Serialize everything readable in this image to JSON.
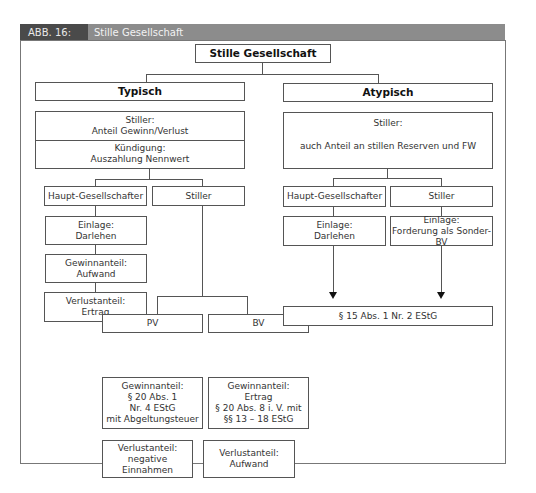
{
  "header": {
    "figure_label": "ABB. 16:",
    "title": "Stille Gesellschaft"
  },
  "diagram": {
    "root": "Stille Gesellschaft",
    "typisch": {
      "label": "Typisch",
      "info": {
        "line1a": "Stiller:",
        "line1b": "Anteil Gewinn/Verlust",
        "line2a": "Kündigung:",
        "line2b": "Auszahlung Nennwert"
      },
      "haupt": {
        "label": "Haupt-Gesellschafter",
        "einlage_a": "Einlage:",
        "einlage_b": "Darlehen",
        "gewinn_a": "Gewinnanteil:",
        "gewinn_b": "Aufwand",
        "verlust_a": "Verlustanteil:",
        "verlust_b": "Ertrag"
      },
      "stiller": {
        "label": "Stiller",
        "pv": {
          "label": "PV",
          "gewinn": [
            "Gewinnanteil:",
            "§ 20 Abs. 1",
            "Nr. 4 EStG",
            "mit Abgeltungsteuer"
          ],
          "verlust": [
            "Verlustanteil:",
            "negative",
            "Einnahmen"
          ]
        },
        "bv": {
          "label": "BV",
          "gewinn": [
            "Gewinnanteil:",
            "Ertrag",
            "§ 20 Abs. 8 i. V. mit",
            "§§ 13 – 18 EStG"
          ],
          "verlust": [
            "Verlustanteil:",
            "Aufwand"
          ]
        }
      }
    },
    "atypisch": {
      "label": "Atypisch",
      "info": {
        "line1": "Stiller:",
        "line2": "auch Anteil an stillen Reserven und FW"
      },
      "haupt": {
        "label": "Haupt-Gesellschafter",
        "einlage_a": "Einlage:",
        "einlage_b": "Darlehen"
      },
      "stiller": {
        "label": "Stiller",
        "einlage_a": "Einlage:",
        "einlage_b": "Forderung als Sonder-BV"
      },
      "result": "§ 15 Abs. 1 Nr. 2 EStG"
    }
  }
}
